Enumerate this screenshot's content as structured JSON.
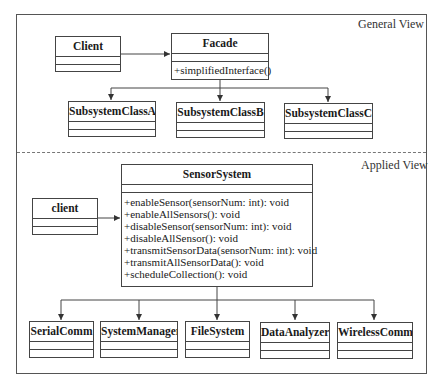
{
  "general_view": {
    "label": "General View",
    "client": {
      "name": "Client"
    },
    "facade": {
      "name": "Facade",
      "methods": [
        "+simplifiedInterface()"
      ]
    },
    "subsystems": [
      {
        "name": "SubsystemClassA"
      },
      {
        "name": "SubsystemClassB"
      },
      {
        "name": "SubsystemClassC"
      }
    ]
  },
  "applied_view": {
    "label": "Applied View",
    "client": {
      "name": "client"
    },
    "sensor_system": {
      "name": "SensorSystem",
      "methods": [
        "+enableSensor(sensorNum: int): void",
        "+enableAllSensors(): void",
        "+disableSensor(sensorNum: int): void",
        "+disableAllSensor(): void",
        "+transmitSensorData(sensorNum: int): void",
        "+transmitAllSensorData(): void",
        "+scheduleCollection(): void"
      ]
    },
    "subsystems": [
      {
        "name": "SerialComm"
      },
      {
        "name": "SystemManager"
      },
      {
        "name": "FileSystem"
      },
      {
        "name": "DataAnalyzer"
      },
      {
        "name": "WirelessComm"
      }
    ]
  },
  "colors": {
    "line": "#444444",
    "dash": "#777777",
    "background": "#ffffff"
  }
}
